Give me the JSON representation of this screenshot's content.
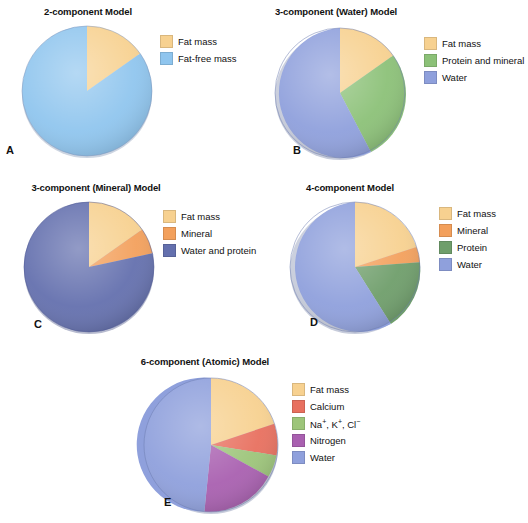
{
  "figure": {
    "background": "#ffffff"
  },
  "colors": {
    "fat_mass": "#F7D190",
    "fat_free_mass": "#8FC5EE",
    "protein_and_mineral": "#8CC178",
    "water_light": "#8FA0DC",
    "mineral": "#F3A05C",
    "water_and_protein": "#6470AE",
    "protein": "#6F9E6B",
    "calcium": "#E8705F",
    "ions": "#9DC57A",
    "nitrogen": "#A960B0"
  },
  "panels": [
    {
      "letter": "A",
      "title": "2-component Model",
      "chart_data": {
        "type": "pie",
        "title": "2-component Model",
        "labels": [
          "Fat mass",
          "Fat-free mass"
        ],
        "values": [
          15,
          85
        ],
        "colors": [
          "#F7D190",
          "#8FC5EE"
        ],
        "start_angle": 0,
        "legend_position": "right"
      },
      "legend": [
        {
          "label": "Fat mass",
          "color": "#F7D190"
        },
        {
          "label": "Fat-free mass",
          "color": "#8FC5EE"
        }
      ]
    },
    {
      "letter": "B",
      "title": "3-component (Water) Model",
      "chart_data": {
        "type": "pie",
        "title": "3-component (Water) Model",
        "labels": [
          "Fat mass",
          "Protein and mineral",
          "Water"
        ],
        "values": [
          15,
          27,
          58
        ],
        "colors": [
          "#F7D190",
          "#8CC178",
          "#8FA0DC"
        ],
        "start_angle": 0,
        "legend_position": "right"
      },
      "legend": [
        {
          "label": "Fat mass",
          "color": "#F7D190"
        },
        {
          "label": "Protein and mineral",
          "color": "#8CC178"
        },
        {
          "label": "Water",
          "color": "#8FA0DC"
        }
      ]
    },
    {
      "letter": "C",
      "title": "3-component (Mineral) Model",
      "chart_data": {
        "type": "pie",
        "title": "3-component (Mineral) Model",
        "labels": [
          "Fat mass",
          "Mineral",
          "Water and protein"
        ],
        "values": [
          15,
          6,
          79
        ],
        "colors": [
          "#F7D190",
          "#F3A05C",
          "#6470AE"
        ],
        "start_angle": 0,
        "legend_position": "right"
      },
      "legend": [
        {
          "label": "Fat mass",
          "color": "#F7D190"
        },
        {
          "label": "Mineral",
          "color": "#F3A05C"
        },
        {
          "label": "Water and protein",
          "color": "#6470AE"
        }
      ]
    },
    {
      "letter": "D",
      "title": "4-component Model",
      "chart_data": {
        "type": "pie",
        "title": "4-component Model",
        "labels": [
          "Fat mass",
          "Mineral",
          "Protein",
          "Water"
        ],
        "values": [
          18,
          5,
          20,
          57
        ],
        "colors": [
          "#F7D190",
          "#F3A05C",
          "#6F9E6B",
          "#8FA0DC"
        ],
        "start_angle": 0,
        "legend_position": "right"
      },
      "legend": [
        {
          "label": "Fat mass",
          "color": "#F7D190"
        },
        {
          "label": "Mineral",
          "color": "#F3A05C"
        },
        {
          "label": "Protein",
          "color": "#6F9E6B"
        },
        {
          "label": "Water",
          "color": "#8FA0DC"
        }
      ]
    },
    {
      "letter": "E",
      "title": "6-component (Atomic) Model",
      "chart_data": {
        "type": "pie",
        "title": "6-component (Atomic) Model",
        "labels": [
          "Fat mass",
          "Calcium",
          "Na+, K+, Cl-",
          "Nitrogen",
          "Water"
        ],
        "values": [
          18,
          7,
          5,
          18,
          52
        ],
        "colors": [
          "#F7D190",
          "#E8705F",
          "#9DC57A",
          "#A960B0",
          "#8FA0DC"
        ],
        "start_angle": 0,
        "legend_position": "right"
      },
      "legend": [
        {
          "label": "Fat mass",
          "color": "#F7D190"
        },
        {
          "label": "Calcium",
          "color": "#E8705F"
        },
        {
          "label": "Na+, K+, Cl-",
          "color": "#9DC57A",
          "html": "Na<sup>+</sup>, K<sup>+</sup>, Cl<sup>&#8722;</sup>"
        },
        {
          "label": "Nitrogen",
          "color": "#A960B0"
        },
        {
          "label": "Water",
          "color": "#8FA0DC"
        }
      ]
    }
  ]
}
